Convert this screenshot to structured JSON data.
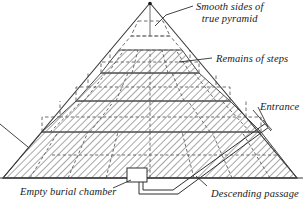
{
  "diagram": {
    "type": "cross-section illustration",
    "colors": {
      "outline": "#3a3a3a",
      "hatch": "#8a8a8a",
      "dashed": "#6e6e6e",
      "text": "#1a1a1a",
      "background": "#ffffff"
    }
  },
  "labels": {
    "smooth_sides_line1": "Smooth sides of",
    "smooth_sides_line2": "true pyramid",
    "remains_of_steps": "Remains of steps",
    "entrance": "Entrance",
    "empty_burial_chamber": "Empty burial chamber",
    "descending_passage": "Descending passage",
    "cut_off_left": ""
  },
  "features": {
    "apex": "pyramid-apex",
    "outer_triangle": "smooth-casing-outline",
    "tiers": [
      {
        "name": "tier-hidden-top",
        "style": "dashed"
      },
      {
        "name": "tier-hidden-second",
        "style": "dashed"
      },
      {
        "name": "tier-1-solid",
        "style": "hatched"
      },
      {
        "name": "tier-2-solid",
        "style": "hatched"
      },
      {
        "name": "tier-3-solid",
        "style": "hatched"
      },
      {
        "name": "tier-4-base",
        "style": "hatched"
      }
    ],
    "chamber": "empty-burial-chamber",
    "passage": "descending-passage",
    "entrance_point": "entrance-opening"
  }
}
